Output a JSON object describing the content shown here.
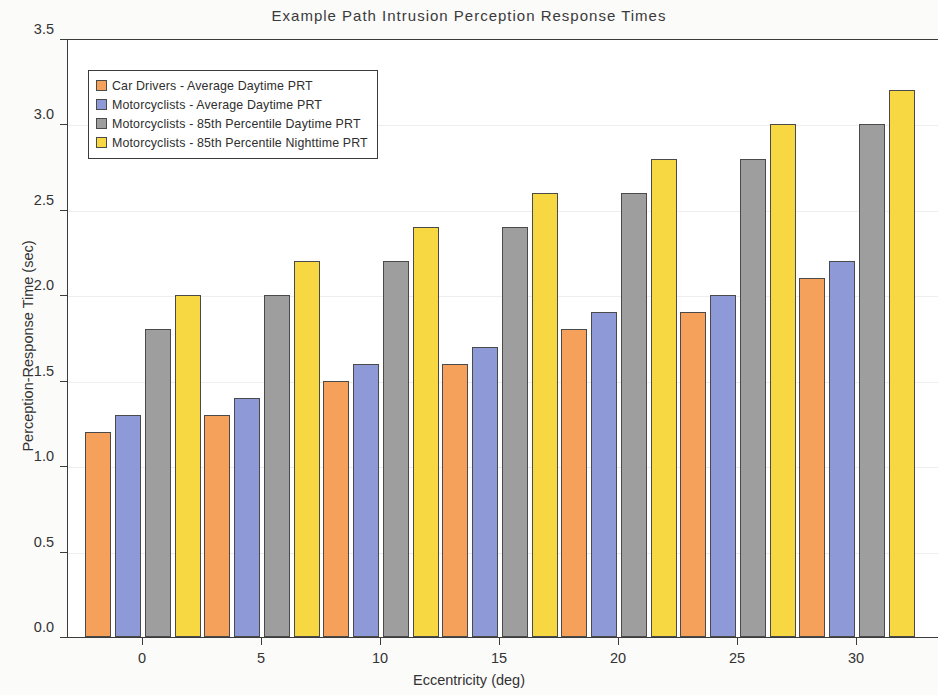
{
  "chart_data": {
    "type": "bar",
    "title": "Example Path Intrusion Perception Response Times",
    "xlabel": "Eccentricity (deg)",
    "ylabel": "Perception-Response Time (sec)",
    "categories": [
      "0",
      "5",
      "10",
      "15",
      "20",
      "25",
      "30"
    ],
    "series": [
      {
        "name": "Car Drivers - Average Daytime PRT",
        "color": "#F5A15C",
        "values": [
          1.2,
          1.3,
          1.5,
          1.6,
          1.8,
          1.9,
          2.1
        ]
      },
      {
        "name": "Motorcyclists -  Average Daytime PRT",
        "color": "#8E9AD8",
        "values": [
          1.3,
          1.4,
          1.6,
          1.7,
          1.9,
          2.0,
          2.2
        ]
      },
      {
        "name": "Motorcyclists - 85th Percentile Daytime PRT",
        "color": "#9E9E9E",
        "values": [
          1.8,
          2.0,
          2.2,
          2.4,
          2.6,
          2.8,
          3.0
        ]
      },
      {
        "name": "Motorcyclists - 85th Percentile Nighttime PRT",
        "color": "#F7D842",
        "values": [
          2.0,
          2.2,
          2.4,
          2.6,
          2.8,
          3.0,
          3.2
        ]
      }
    ],
    "ylim": [
      0.0,
      3.5
    ],
    "ytick_labels": [
      "0.0",
      "0.5",
      "1.0",
      "1.5",
      "2.0",
      "2.5",
      "3.0",
      "3.5"
    ],
    "ytick_values": [
      0.0,
      0.5,
      1.0,
      1.5,
      2.0,
      2.5,
      3.0,
      3.5
    ],
    "xtick_labels": [
      "0",
      "5",
      "10",
      "15",
      "20",
      "25",
      "30"
    ],
    "grid": true,
    "legend_position": "upper left"
  },
  "axis_color": "#3b3b3b",
  "plot_background": "#ffffff",
  "page_background": "#fbfbfa"
}
